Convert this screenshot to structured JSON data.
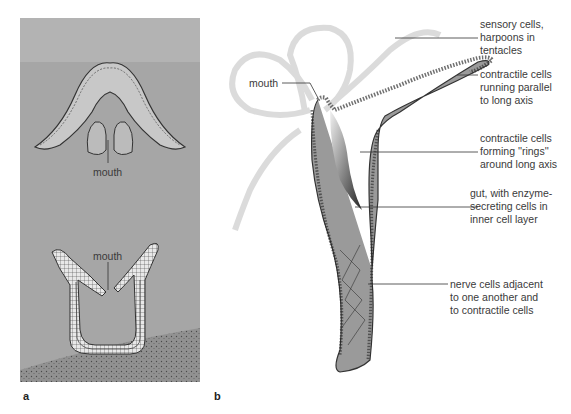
{
  "figure": {
    "panels": [
      {
        "id": "a",
        "letter": "a",
        "description": "Cnidarian body plans (medusa and polyp) cross-sections",
        "labels": {
          "mouth_top": "mouth",
          "mouth_bottom": "mouth"
        }
      },
      {
        "id": "b",
        "letter": "b",
        "description": "Hydra body structure",
        "labels": {
          "mouth": "mouth",
          "sensory": "sensory cells,\nharpoons in\ntentacles",
          "contractile_parallel": "contractile cells\nrunning parallel\nto long axis",
          "contractile_rings": "contractile cells\nforming ''rings''\naround long axis",
          "gut": "gut, with enzyme-\nsecreting cells in\ninner cell layer",
          "nerve": "nerve cells adjacent\nto one another and\nto contractile cells"
        }
      }
    ]
  }
}
